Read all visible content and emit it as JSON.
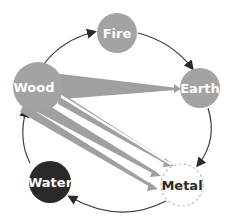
{
  "diagram": {
    "colors": {
      "background": "#ffffff",
      "cycle_line": "#3a3a3a",
      "node_gray": "#a3a3a3",
      "node_dark": "#2a2a2a",
      "node_outline_dashed": "#bdbdbd",
      "wedge_gray": "#a0a0a0",
      "text_light": "#ffffff",
      "text_dark": "#2a2a2a"
    },
    "nodes": [
      {
        "id": "fire",
        "label": "Fire",
        "style": "gray"
      },
      {
        "id": "earth",
        "label": "Earth",
        "style": "gray"
      },
      {
        "id": "metal",
        "label": "Metal",
        "style": "dashed-white"
      },
      {
        "id": "water",
        "label": "Water",
        "style": "dark"
      },
      {
        "id": "wood",
        "label": "Wood",
        "style": "gray"
      }
    ],
    "cycle_edges": [
      {
        "from": "wood",
        "to": "fire"
      },
      {
        "from": "fire",
        "to": "earth"
      },
      {
        "from": "earth",
        "to": "metal"
      },
      {
        "from": "metal",
        "to": "water"
      },
      {
        "from": "water",
        "to": "wood"
      }
    ],
    "wedge_edges": [
      {
        "from": "wood",
        "to": "earth"
      },
      {
        "from": "wood",
        "to": "metal"
      },
      {
        "from": "wood",
        "to": "metal"
      },
      {
        "from": "wood",
        "to": "metal"
      }
    ]
  }
}
